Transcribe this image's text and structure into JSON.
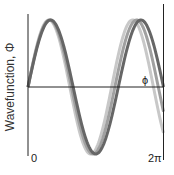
{
  "diagram": {
    "y_axis_label": "Wavefunction, Φ",
    "x_axis_symbol": "ϕ",
    "x_start_label": "0",
    "x_end_label": "2π",
    "curves": [
      {
        "name": "light-curve",
        "color": "#c8c8c8",
        "cycles": 1.62
      },
      {
        "name": "medium-curve",
        "color": "#a0a0a0",
        "cycles": 1.56
      },
      {
        "name": "dark-curve",
        "color": "#666666",
        "cycles": 1.5
      }
    ],
    "axis_color": "#222222"
  }
}
